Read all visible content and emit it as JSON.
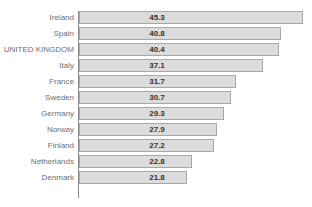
{
  "chart_data": {
    "type": "bar",
    "orientation": "horizontal",
    "title": "",
    "xlabel": "",
    "ylabel": "",
    "xlim": [
      0,
      47
    ],
    "grid": false,
    "legend": null,
    "highlighted_category": "UNITED KINGDOM",
    "categories": [
      "Ireland",
      "Spain",
      "UNITED KINGDOM",
      "Italy",
      "France",
      "Sweden",
      "Germany",
      "Norway",
      "Finland",
      "Netherlands",
      "Denmark"
    ],
    "values": [
      45.3,
      40.8,
      40.4,
      37.1,
      31.7,
      30.7,
      29.3,
      27.9,
      27.2,
      22.8,
      21.8
    ],
    "value_labels": [
      "45.3",
      "40.8",
      "40.4",
      "37.1",
      "31.7",
      "30.7",
      "29.3",
      "27.9",
      "27.2",
      "22.8",
      "21.8"
    ]
  },
  "style": {
    "bar_fill": "#dcdcdc",
    "bar_border": "#a8a8a8",
    "axis_color": "#8a8a8a",
    "category_text": "#6e6e6e",
    "value_text": "#333333",
    "background": "#ffffff"
  },
  "geometry": {
    "axis_x": 78,
    "px_per_unit": 4.95,
    "bar_height": 13,
    "row_pitch": 16,
    "plot_top": 11
  }
}
